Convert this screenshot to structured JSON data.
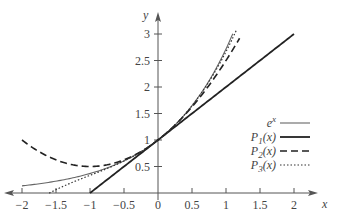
{
  "chart_data": {
    "type": "line",
    "title": "",
    "xlabel": "x",
    "ylabel": "y",
    "xlim": [
      -2.1,
      2.3
    ],
    "ylim": [
      0,
      3.35
    ],
    "xticks": [
      -2,
      -1.5,
      -1,
      -0.5,
      0,
      0.5,
      1,
      1.5,
      2
    ],
    "xtick_labels": [
      "−2",
      "−1.5",
      "−1",
      "−0.5",
      "0",
      "0.5",
      "1",
      "1.5",
      "2"
    ],
    "yticks": [
      0.5,
      1,
      1.5,
      2,
      2.5,
      3
    ],
    "ytick_labels": [
      "0.5",
      "1",
      "1.5",
      "2",
      "2.5",
      "3"
    ],
    "grid": false,
    "legend_position": "center-right",
    "series": [
      {
        "name": "e^x",
        "label_main": "e",
        "label_sup": "x",
        "style": "solid-thin",
        "formula": "exp(x)",
        "x_range": [
          -2,
          1.1
        ],
        "color": "#666666"
      },
      {
        "name": "P1(x)",
        "label_main": "P",
        "label_sub": "1",
        "label_tail": "(x)",
        "style": "solid-thick",
        "formula": "1 + x",
        "x_range": [
          -1,
          2
        ],
        "color": "#222222"
      },
      {
        "name": "P2(x)",
        "label_main": "P",
        "label_sub": "2",
        "label_tail": "(x)",
        "style": "dashed",
        "formula": "1 + x + x^2/2",
        "x_range": [
          -2,
          1.2
        ],
        "color": "#222222"
      },
      {
        "name": "P3(x)",
        "label_main": "P",
        "label_sub": "3",
        "label_tail": "(x)",
        "style": "dotted",
        "formula": "1 + x + x^2/2 + x^3/6",
        "x_range": [
          -1.6,
          1.15
        ],
        "color": "#333333"
      }
    ]
  }
}
